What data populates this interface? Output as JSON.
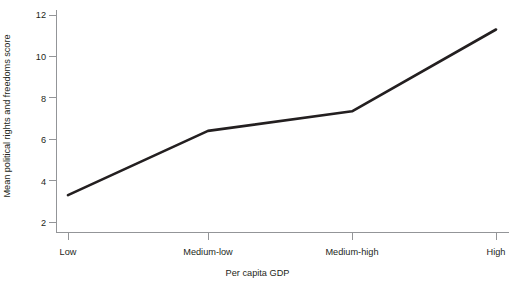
{
  "chart_data": {
    "type": "line",
    "title": "",
    "subtitle": "",
    "xlabel": "Per capita GDP",
    "ylabel": "Mean political rights and freedoms score",
    "categories": [
      "Low",
      "Medium-low",
      "Medium-high",
      "High"
    ],
    "values": [
      3.3,
      6.4,
      7.35,
      11.3
    ],
    "series": [
      {
        "name": "Mean political rights and freedoms score",
        "values": [
          3.3,
          6.4,
          7.35,
          11.3
        ],
        "color": "#231f20"
      }
    ],
    "ylim": [
      2,
      12
    ],
    "yticks": [
      2,
      4,
      6,
      8,
      10,
      12
    ],
    "ytick_labels": [
      "2",
      "4",
      "6",
      "8",
      "10",
      "12"
    ],
    "xtick_labels": [
      "Low",
      "Medium-low",
      "Medium-high",
      "High"
    ],
    "grid": false,
    "legend": false,
    "legend_position": "none",
    "axis_color": "#939598",
    "line_color": "#231f20",
    "background": "#ffffff"
  },
  "axes": {
    "y_title": "Mean political rights and freedoms score",
    "x_title": "Per capita GDP",
    "y_ticks": [
      {
        "label": "12",
        "value": 12
      },
      {
        "label": "10",
        "value": 10
      },
      {
        "label": "8",
        "value": 8
      },
      {
        "label": "6",
        "value": 6
      },
      {
        "label": "4",
        "value": 4
      },
      {
        "label": "2",
        "value": 2
      }
    ],
    "x_ticks": [
      {
        "label": "Low",
        "value": 0
      },
      {
        "label": "Medium-low",
        "value": 1
      },
      {
        "label": "Medium-high",
        "value": 2
      },
      {
        "label": "High",
        "value": 3
      }
    ]
  },
  "caption": {
    "text": "",
    "visible_fragment": ""
  }
}
